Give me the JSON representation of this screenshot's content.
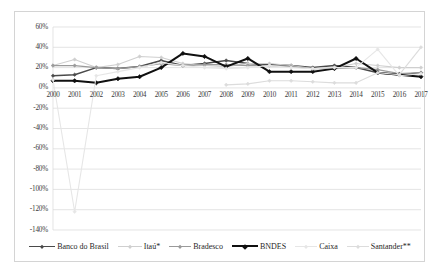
{
  "chart_data": {
    "type": "line",
    "title": "",
    "xlabel": "",
    "ylabel": "",
    "x": [
      2000,
      2001,
      2002,
      2003,
      2004,
      2005,
      2006,
      2007,
      2008,
      2009,
      2010,
      2011,
      2012,
      2013,
      2014,
      2015,
      2016,
      2017
    ],
    "ylim": [
      -140,
      60
    ],
    "ytick_labels": [
      "60%",
      "40%",
      "20%",
      "0%",
      "-20%",
      "-40%",
      "-60%",
      "-80%",
      "-100%",
      "-120%",
      "-140%"
    ],
    "ytick_values": [
      60,
      40,
      20,
      0,
      -20,
      -40,
      -60,
      -80,
      -100,
      -120,
      -140
    ],
    "xtick_labels": [
      "2000",
      "2001",
      "2002",
      "2003",
      "2004",
      "2005",
      "2006",
      "2007",
      "2008",
      "2009",
      "2010",
      "2011",
      "2012",
      "2013",
      "2014",
      "2015",
      "2016",
      "2017"
    ],
    "grid": true,
    "legend_position": "bottom",
    "series": [
      {
        "name": "Banco do Brasil",
        "color": "#4a4a4a",
        "width": 1.5,
        "marker": "diamond",
        "values": [
          12,
          13,
          20,
          19,
          21,
          27,
          22,
          24,
          27,
          24,
          23,
          22,
          20,
          22,
          20,
          15,
          13,
          15
        ]
      },
      {
        "name": "Itaú*",
        "color": "#cfcfcf",
        "width": 1.1,
        "marker": "diamond",
        "values": [
          22,
          28,
          20,
          23,
          31,
          30,
          24,
          22,
          21,
          24,
          24,
          22,
          19,
          20,
          24,
          22,
          20,
          20
        ]
      },
      {
        "name": "Bradesco",
        "color": "#9a9a9a",
        "width": 1.2,
        "marker": "diamond",
        "values": [
          22,
          22,
          20,
          19,
          21,
          24,
          22,
          23,
          23,
          22,
          22,
          21,
          19,
          19,
          20,
          18,
          14,
          15
        ]
      },
      {
        "name": "BNDES",
        "color": "#101010",
        "width": 2.0,
        "marker": "diamond",
        "values": [
          7,
          7,
          5,
          9,
          11,
          20,
          34,
          31,
          21,
          29,
          16,
          16,
          16,
          19,
          29,
          15,
          13,
          11
        ]
      },
      {
        "name": "Caixa",
        "color": "#e6e6e6",
        "width": 1.1,
        "marker": "diamond",
        "values": [
          8,
          -122,
          12,
          16,
          20,
          25,
          22,
          20,
          19,
          20,
          22,
          20,
          19,
          20,
          20,
          38,
          12,
          14
        ]
      },
      {
        "name": "Santander**",
        "color": "#dcdcdc",
        "width": 1.1,
        "marker": "diamond",
        "values": [
          null,
          null,
          null,
          null,
          null,
          null,
          null,
          null,
          3,
          4,
          7,
          7,
          6,
          5,
          5,
          15,
          13,
          40
        ]
      }
    ]
  }
}
